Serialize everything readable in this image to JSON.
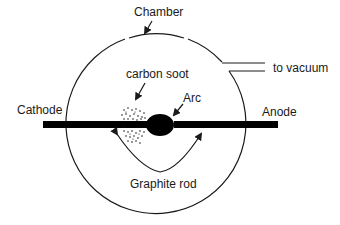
{
  "diagram": {
    "labels": {
      "chamber": "Chamber",
      "vacuum": "to vacuum",
      "carbon_soot": "carbon soot",
      "arc": "Arc",
      "cathode": "Cathode",
      "anode": "Anode",
      "graphite_rod": "Graphite rod"
    },
    "colors": {
      "stroke": "#1a1a1a",
      "fill": "#000000",
      "background": "#ffffff"
    }
  }
}
